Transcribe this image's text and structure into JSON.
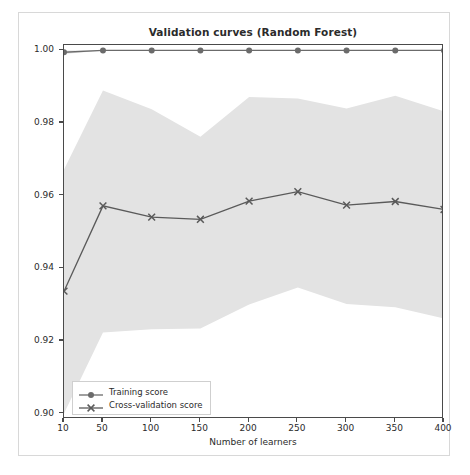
{
  "figure": {
    "title": "Validation curves (Random Forest)",
    "background_color": "#ffffff",
    "border_color": "#d8d8d8",
    "axes_color": "#4a4a4a",
    "text_color": "#2b2b2b"
  },
  "axes": {
    "xlabel": "Number of learners",
    "ylabel": "Accuracy",
    "ytick_labels": [
      "1.00",
      "0.98",
      "0.96",
      "0.94",
      "0.92",
      "0.90"
    ],
    "ytick_values": [
      1.0,
      0.98,
      0.96,
      0.94,
      0.92,
      0.9
    ],
    "xtick_labels": [
      "10",
      "50",
      "100",
      "150",
      "200",
      "250",
      "300",
      "350",
      "400"
    ],
    "xtick_values": [
      10,
      50,
      100,
      150,
      200,
      250,
      300,
      350,
      400
    ]
  },
  "legend": {
    "position": "lower left",
    "entries": [
      {
        "label": "Training score",
        "marker": "circle-marker",
        "color": "#6b6b6b"
      },
      {
        "label": "Cross-validation score",
        "marker": "x-marker",
        "color": "#5a5a5a"
      }
    ]
  },
  "chart_data": {
    "type": "line",
    "title": "Validation curves (Random Forest)",
    "xlabel": "Number of learners",
    "ylabel": "Accuracy",
    "xlim": [
      10,
      400
    ],
    "ylim": [
      0.8985,
      1.0015
    ],
    "grid": false,
    "legend_position": "lower left",
    "x": [
      10,
      50,
      100,
      150,
      200,
      250,
      300,
      350,
      400
    ],
    "series": [
      {
        "name": "Training score",
        "marker": "circle-marker",
        "color": "#6b6b6b",
        "values": [
          0.9995,
          1.0,
          1.0,
          1.0,
          1.0,
          1.0,
          1.0,
          1.0,
          1.0
        ],
        "band_color": "#e3e3e3",
        "band_upper": [
          1.0,
          1.0,
          1.0,
          1.0,
          1.0,
          1.0,
          1.0,
          1.0,
          1.0
        ],
        "band_lower": [
          0.999,
          1.0,
          1.0,
          1.0,
          1.0,
          1.0,
          1.0,
          1.0,
          1.0
        ]
      },
      {
        "name": "Cross-validation score",
        "marker": "x-marker",
        "color": "#5a5a5a",
        "values": [
          0.9337,
          0.9572,
          0.9541,
          0.9535,
          0.9585,
          0.9611,
          0.9574,
          0.9584,
          0.9562
        ],
        "band_color": "#e3e3e3",
        "band_upper": [
          0.9672,
          0.989,
          0.9838,
          0.9762,
          0.9872,
          0.9868,
          0.984,
          0.9875,
          0.9832
        ],
        "band_lower": [
          0.9,
          0.9223,
          0.9232,
          0.9234,
          0.93,
          0.9347,
          0.9302,
          0.9293,
          0.9262
        ]
      }
    ]
  }
}
